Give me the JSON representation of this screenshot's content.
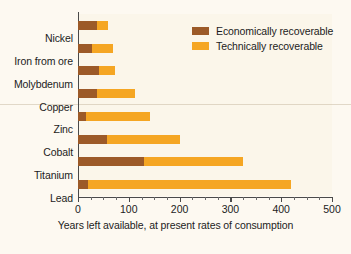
{
  "chart_data": {
    "type": "bar",
    "orientation": "horizontal",
    "stacked": true,
    "title": "",
    "xlabel": "Years left available, at present rates of consumption",
    "ylabel": "",
    "xlim": [
      0,
      500
    ],
    "xticks": [
      0,
      100,
      200,
      300,
      400,
      500
    ],
    "xtick_labels": [
      "0",
      "100",
      "200",
      "300",
      "400",
      "500"
    ],
    "minor_tick_interval": 25,
    "grid": false,
    "legend_position": "top-right",
    "categories": [
      "Nickel",
      "Iron from ore",
      "Molybdenum",
      "Copper",
      "Zinc",
      "Cobalt",
      "Titanium",
      "Lead"
    ],
    "series": [
      {
        "name": "Economically recoverable",
        "color": "#9c5a28",
        "values": [
          37,
          27,
          42,
          38,
          16,
          57,
          130,
          20
        ]
      },
      {
        "name": "Technically recoverable",
        "color": "#f5a623",
        "values": [
          59,
          69,
          73,
          112,
          142,
          201,
          325,
          420
        ]
      }
    ]
  },
  "legend": {
    "items": [
      {
        "label": "Economically recoverable",
        "color": "#9c5a28"
      },
      {
        "label": "Technically recoverable",
        "color": "#f5a623"
      }
    ]
  },
  "axis": {
    "x_title": "Years left available, at present rates of consumption"
  }
}
